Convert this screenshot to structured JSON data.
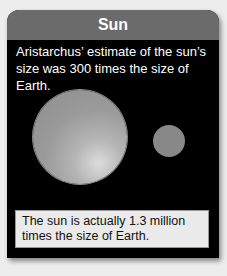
{
  "card": {
    "title": "Sun",
    "intro_text": "Aristarchus’ estimate of the sun’s size was 300 times the size of Earth.",
    "caption_text": "The sun is actually 1.3 million times the size of Earth.",
    "illustration": {
      "large_circle": "sun",
      "small_circle": "earth"
    }
  }
}
